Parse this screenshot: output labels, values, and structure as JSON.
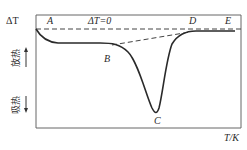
{
  "diagram": {
    "type": "DTA curve",
    "y_axis_label": "ΔT",
    "x_axis_label": "T/K",
    "baseline_label": "ΔT=0",
    "exothermic_label": "放热",
    "endothermic_label": "吸热",
    "points": [
      "A",
      "B",
      "C",
      "D",
      "E"
    ],
    "colors": {
      "curve": "#2a2a2a",
      "frame": "#555555",
      "dashed": "#444444"
    }
  }
}
